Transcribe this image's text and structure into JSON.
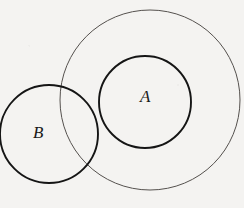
{
  "figure": {
    "kind": "venn-diagram",
    "background_color": "#f4f3f1",
    "width": 244,
    "height": 208,
    "shapes": [
      {
        "name": "universe-circle",
        "label": "",
        "cx": 150,
        "cy": 100,
        "r": 90,
        "stroke": "#55514e",
        "stroke_width": 1.0,
        "fill": "none"
      },
      {
        "name": "circle-a",
        "label": "A",
        "cx": 145,
        "cy": 102,
        "r": 46,
        "stroke": "#151515",
        "stroke_width": 1.9,
        "fill": "none"
      },
      {
        "name": "circle-b",
        "label": "B",
        "cx": 49,
        "cy": 134,
        "r": 49,
        "stroke": "#151515",
        "stroke_width": 1.9,
        "fill": "none"
      }
    ],
    "labels": {
      "a": "A",
      "b": "B"
    }
  }
}
